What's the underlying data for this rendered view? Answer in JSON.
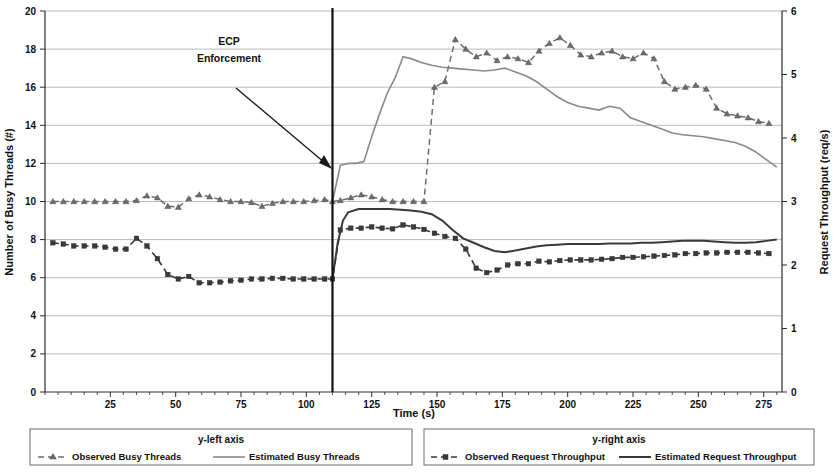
{
  "chart_data": {
    "type": "line",
    "title": "",
    "xlabel": "Time (s)",
    "ylabel_left": "Number of Busy Threads (#)",
    "ylabel_right": "Request Throughput (req/s)",
    "xlim": [
      0,
      282
    ],
    "ylim_left": [
      0,
      20
    ],
    "ylim_right": [
      0,
      6
    ],
    "xticks": [
      25,
      50,
      75,
      100,
      125,
      150,
      175,
      200,
      225,
      250,
      275
    ],
    "yticks_left": [
      0,
      2,
      4,
      6,
      8,
      10,
      12,
      14,
      16,
      18,
      20
    ],
    "yticks_right": [
      0,
      1,
      2,
      3,
      4,
      5,
      6
    ],
    "grid": "horizontal",
    "legend_position": "bottom",
    "annotations": [
      {
        "text_line1": "ECP",
        "text_line2": "Enforcement",
        "target_x": 110,
        "marker_type": "vertical-line-with-arrow"
      }
    ],
    "series": [
      {
        "name": "Observed Busy Threads",
        "axis": "left",
        "style": "dashed",
        "marker": "triangle",
        "color": "#6e6e6e",
        "x": [
          3,
          7,
          11,
          15,
          19,
          23,
          27,
          31,
          35,
          39,
          43,
          47,
          51,
          55,
          59,
          63,
          67,
          71,
          75,
          79,
          83,
          87,
          91,
          95,
          99,
          103,
          107,
          110,
          113,
          117,
          121,
          125,
          129,
          133,
          137,
          141,
          145,
          149,
          153,
          157,
          161,
          165,
          169,
          173,
          177,
          181,
          185,
          189,
          193,
          197,
          201,
          205,
          209,
          213,
          217,
          221,
          225,
          229,
          233,
          237,
          241,
          245,
          249,
          253,
          257,
          261,
          265,
          269,
          273,
          277
        ],
        "y": [
          10.0,
          10.0,
          10.0,
          10.0,
          10.0,
          10.0,
          10.0,
          10.0,
          10.05,
          10.3,
          10.2,
          9.75,
          9.7,
          10.15,
          10.35,
          10.25,
          10.1,
          10.0,
          10.0,
          9.95,
          9.75,
          9.9,
          10.0,
          10.0,
          10.0,
          10.05,
          10.1,
          10.0,
          10.05,
          10.2,
          10.35,
          10.25,
          10.1,
          10.0,
          10.0,
          10.0,
          10.0,
          16.0,
          16.3,
          18.5,
          18.0,
          17.6,
          17.8,
          17.4,
          17.6,
          17.5,
          17.3,
          17.9,
          18.3,
          18.6,
          18.2,
          17.7,
          17.6,
          17.8,
          17.9,
          17.6,
          17.5,
          17.8,
          17.5,
          16.3,
          15.9,
          16.0,
          16.1,
          15.9,
          14.9,
          14.6,
          14.5,
          14.4,
          14.2,
          14.1
        ]
      },
      {
        "name": "Estimated Busy Threads",
        "axis": "left",
        "style": "solid",
        "marker": "none",
        "color": "#8a8a8a",
        "x": [
          110,
          113,
          116,
          119,
          122,
          125,
          128,
          131,
          134,
          137,
          140,
          144,
          148,
          152,
          156,
          160,
          164,
          168,
          172,
          176,
          180,
          184,
          188,
          192,
          196,
          200,
          204,
          208,
          212,
          216,
          220,
          224,
          228,
          232,
          236,
          240,
          244,
          248,
          252,
          256,
          260,
          264,
          268,
          272,
          276,
          280
        ],
        "y": [
          10.0,
          11.9,
          12.0,
          12.0,
          12.1,
          13.4,
          14.6,
          15.7,
          16.5,
          17.6,
          17.5,
          17.3,
          17.15,
          17.05,
          17.0,
          16.95,
          16.9,
          16.85,
          16.9,
          17.0,
          16.8,
          16.6,
          16.3,
          15.9,
          15.5,
          15.2,
          15.0,
          14.9,
          14.8,
          15.0,
          14.9,
          14.4,
          14.2,
          14.0,
          13.8,
          13.6,
          13.5,
          13.45,
          13.4,
          13.3,
          13.2,
          13.1,
          12.9,
          12.6,
          12.2,
          11.8
        ]
      },
      {
        "name": "Observed Request Throughput",
        "axis": "right",
        "style": "dashed",
        "marker": "square",
        "color": "#3a3a3a",
        "x": [
          3,
          7,
          11,
          15,
          19,
          23,
          27,
          31,
          35,
          39,
          43,
          47,
          51,
          55,
          59,
          63,
          67,
          71,
          75,
          79,
          83,
          87,
          91,
          95,
          99,
          103,
          107,
          110,
          113,
          117,
          121,
          125,
          129,
          133,
          137,
          141,
          145,
          149,
          153,
          157,
          161,
          165,
          169,
          173,
          177,
          181,
          185,
          189,
          193,
          197,
          201,
          205,
          209,
          213,
          217,
          221,
          225,
          229,
          233,
          237,
          241,
          245,
          249,
          253,
          257,
          261,
          265,
          269,
          273,
          277
        ],
        "y": [
          2.35,
          2.33,
          2.3,
          2.3,
          2.3,
          2.28,
          2.25,
          2.25,
          2.42,
          2.3,
          2.1,
          1.85,
          1.78,
          1.82,
          1.72,
          1.72,
          1.73,
          1.75,
          1.76,
          1.78,
          1.78,
          1.79,
          1.79,
          1.78,
          1.78,
          1.78,
          1.78,
          1.78,
          2.55,
          2.58,
          2.58,
          2.6,
          2.58,
          2.57,
          2.63,
          2.6,
          2.56,
          2.5,
          2.45,
          2.42,
          2.25,
          1.95,
          1.88,
          1.92,
          2.0,
          2.02,
          2.02,
          2.06,
          2.05,
          2.07,
          2.08,
          2.08,
          2.08,
          2.09,
          2.1,
          2.12,
          2.12,
          2.13,
          2.14,
          2.15,
          2.16,
          2.18,
          2.18,
          2.19,
          2.19,
          2.2,
          2.2,
          2.2,
          2.19,
          2.18
        ]
      },
      {
        "name": "Estimated Request Throughput",
        "axis": "right",
        "style": "solid",
        "marker": "none",
        "color": "#3a3a3a",
        "x": [
          110,
          112,
          114,
          116,
          120,
          124,
          128,
          132,
          136,
          140,
          144,
          148,
          152,
          156,
          160,
          164,
          168,
          172,
          176,
          180,
          184,
          188,
          192,
          196,
          200,
          204,
          208,
          212,
          216,
          220,
          224,
          228,
          232,
          236,
          240,
          244,
          248,
          252,
          256,
          260,
          264,
          268,
          272,
          276,
          280
        ],
        "y": [
          1.78,
          2.35,
          2.7,
          2.83,
          2.88,
          2.88,
          2.88,
          2.88,
          2.87,
          2.86,
          2.84,
          2.8,
          2.7,
          2.55,
          2.42,
          2.35,
          2.28,
          2.22,
          2.2,
          2.23,
          2.26,
          2.29,
          2.31,
          2.32,
          2.33,
          2.33,
          2.33,
          2.33,
          2.34,
          2.34,
          2.34,
          2.35,
          2.35,
          2.36,
          2.37,
          2.38,
          2.38,
          2.38,
          2.37,
          2.36,
          2.35,
          2.35,
          2.36,
          2.38,
          2.4
        ]
      }
    ]
  },
  "axes": {
    "x_title": "Time (s)",
    "y_left_title": "Number of Busy Threads (#)",
    "y_right_title": "Request Throughput (req/s)"
  },
  "annotation": {
    "line1": "ECP",
    "line2": "Enforcement"
  },
  "legend": {
    "left_group_title": "y-left axis",
    "right_group_title": "y-right axis",
    "entries": [
      {
        "label": "Observed Busy Threads",
        "group": "left",
        "style": "dashed-triangle"
      },
      {
        "label": "Estimated Busy Threads",
        "group": "left",
        "style": "solid"
      },
      {
        "label": "Observed Request Throughput",
        "group": "right",
        "style": "dashed-square"
      },
      {
        "label": "Estimated Request Throughput",
        "group": "right",
        "style": "solid"
      }
    ]
  }
}
